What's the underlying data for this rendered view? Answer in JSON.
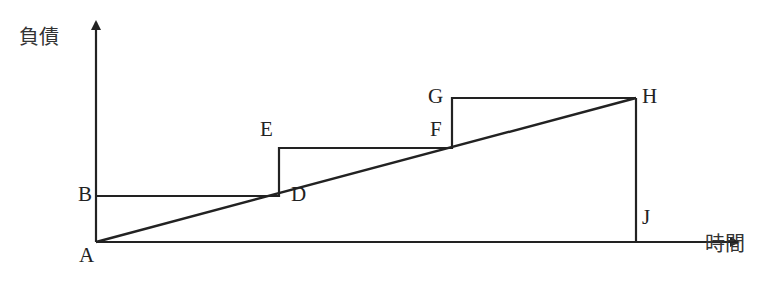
{
  "diagram": {
    "axes": {
      "y_label": "負債",
      "x_label": "時間"
    },
    "points": {
      "A": "A",
      "B": "B",
      "D": "D",
      "E": "E",
      "F": "F",
      "G": "G",
      "H": "H",
      "J": "J"
    },
    "segments": [
      {
        "name": "step-1",
        "from": "A",
        "to": "B-level",
        "desc": "vertical step up from A to B"
      },
      {
        "name": "step-1-horizontal",
        "from": "B",
        "to": "D"
      },
      {
        "name": "step-2-vertical",
        "from": "D",
        "to": "E"
      },
      {
        "name": "step-2-horizontal",
        "from": "E",
        "to": "F"
      },
      {
        "name": "step-3-vertical",
        "from": "F",
        "to": "G"
      },
      {
        "name": "step-3-horizontal",
        "from": "G",
        "to": "H"
      },
      {
        "name": "diagonal",
        "from": "A",
        "to": "H"
      },
      {
        "name": "drop",
        "from": "H",
        "to": "J"
      }
    ],
    "colors": {
      "line": "#222222",
      "background": "#ffffff"
    }
  }
}
